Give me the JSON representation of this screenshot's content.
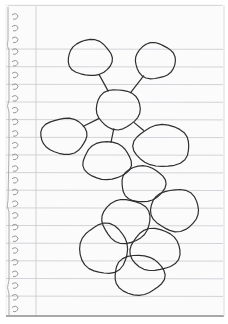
{
  "image": {
    "description": "Hand-drawn bubble diagram (web) on spiral-torn lined notebook paper",
    "paper_color": "#fbfbfb",
    "rule_color": "#bfc3c8",
    "margin_color": "#c9c9c9",
    "ink_color": "#2f2f2f",
    "text_labels": []
  },
  "diagram": {
    "type": "bubble-map",
    "node_count": 12,
    "nodes": [
      {
        "id": "top-left",
        "label": ""
      },
      {
        "id": "top-right",
        "label": ""
      },
      {
        "id": "center",
        "label": ""
      },
      {
        "id": "left",
        "label": ""
      },
      {
        "id": "right",
        "label": ""
      },
      {
        "id": "lower-center",
        "label": ""
      },
      {
        "id": "cluster-1",
        "label": ""
      },
      {
        "id": "cluster-2",
        "label": ""
      },
      {
        "id": "cluster-3",
        "label": ""
      },
      {
        "id": "cluster-4",
        "label": ""
      },
      {
        "id": "cluster-5",
        "label": ""
      },
      {
        "id": "cluster-6",
        "label": ""
      }
    ],
    "edges": [
      {
        "from": "top-left",
        "to": "center"
      },
      {
        "from": "top-right",
        "to": "center"
      },
      {
        "from": "center",
        "to": "left"
      },
      {
        "from": "center",
        "to": "lower-center"
      },
      {
        "from": "center",
        "to": "right"
      }
    ]
  }
}
